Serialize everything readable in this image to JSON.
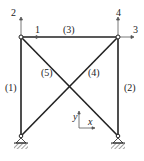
{
  "diagram": {
    "type": "truss",
    "nodes": [
      {
        "id": "top-left",
        "x": 21,
        "y": 37
      },
      {
        "id": "top-right",
        "x": 118,
        "y": 37
      },
      {
        "id": "bottom-left",
        "x": 21,
        "y": 136
      },
      {
        "id": "bottom-right",
        "x": 118,
        "y": 136
      }
    ],
    "members": [
      {
        "label": "(1)",
        "from": "bottom-left",
        "to": "top-left"
      },
      {
        "label": "(2)",
        "from": "bottom-right",
        "to": "top-right"
      },
      {
        "label": "(3)",
        "from": "top-left",
        "to": "top-right"
      },
      {
        "label": "(4)",
        "from": "bottom-left",
        "to": "top-right"
      },
      {
        "label": "(5)",
        "from": "top-left",
        "to": "bottom-right"
      }
    ],
    "dof_labels": {
      "d1": "1",
      "d2": "2",
      "d3": "3",
      "d4": "4"
    },
    "axes": {
      "x": "x",
      "y": "y"
    },
    "supports": [
      "pin-left",
      "pin-right"
    ],
    "line_color": "#222222"
  }
}
